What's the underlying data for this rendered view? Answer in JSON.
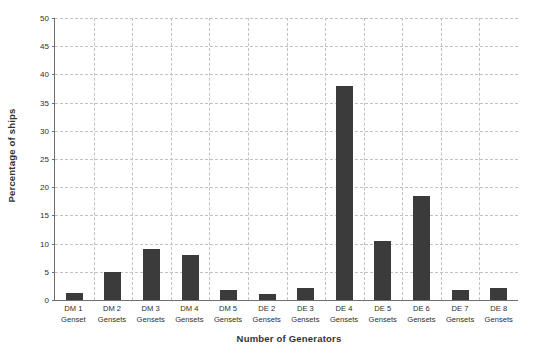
{
  "chart_data": {
    "type": "bar",
    "title": "",
    "xlabel": "Number of Generators",
    "ylabel": "Percentage of ships",
    "categories": [
      "DM 1 Genset",
      "DM 2 Gensets",
      "DM 3 Gensets",
      "DM 4 Gensets",
      "DM 5 Gensets",
      "DE 2 Gensets",
      "DE 3 Gensets",
      "DE 4 Gensets",
      "DE 5 Gensets",
      "DE 6 Gensets",
      "DE 7 Gensets",
      "DE 8 Gensets"
    ],
    "category_lines": [
      [
        "DM 1",
        "Genset"
      ],
      [
        "DM 2",
        "Gensets"
      ],
      [
        "DM 3",
        "Gensets"
      ],
      [
        "DM 4",
        "Gensets"
      ],
      [
        "DM 5",
        "Gensets"
      ],
      [
        "DE 2",
        "Gensets"
      ],
      [
        "DE 3",
        "Gensets"
      ],
      [
        "DE 4",
        "Gensets"
      ],
      [
        "DE 5",
        "Gensets"
      ],
      [
        "DE 6",
        "Gensets"
      ],
      [
        "DE 7",
        "Gensets"
      ],
      [
        "DE 8",
        "Gensets"
      ]
    ],
    "values": [
      1.2,
      5.0,
      9.0,
      8.0,
      1.7,
      1.1,
      2.2,
      38.0,
      10.5,
      18.5,
      1.7,
      2.2
    ],
    "ylim": [
      0,
      50
    ],
    "ytick_labels": [
      "0",
      "5",
      "10",
      "15",
      "20",
      "25",
      "30",
      "35",
      "40",
      "45",
      "50"
    ],
    "ytick_values": [
      0,
      5,
      10,
      15,
      20,
      25,
      30,
      35,
      40,
      45,
      50
    ],
    "grid": true,
    "grid_style": "dashed",
    "legend": "none",
    "bar_color": "#3b3b3b",
    "grid_color": "#c2c2c2",
    "axis_color": "#6f6f6f",
    "background_color": "#ffffff"
  }
}
